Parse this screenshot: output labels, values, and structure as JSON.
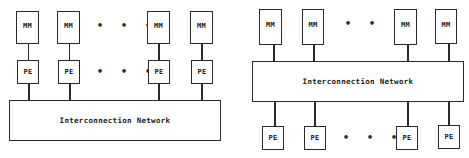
{
  "left_diagram": {
    "memory_modules": [
      {
        "label": "MM"
      },
      {
        "label": "MM"
      },
      {
        "label": "MM"
      },
      {
        "label": "MM"
      }
    ],
    "processing_elements": [
      {
        "label": "PE"
      },
      {
        "label": "PE"
      },
      {
        "label": "PE"
      },
      {
        "label": "PE"
      }
    ],
    "ellipsis_top": "• • •",
    "ellipsis_middle": "• • •",
    "network_label": "Interconnection Network"
  },
  "right_diagram": {
    "memory_modules": [
      {
        "label": "MM"
      },
      {
        "label": "MM"
      },
      {
        "label": "MM"
      },
      {
        "label": "MM"
      }
    ],
    "processing_elements": [
      {
        "label": "PE"
      },
      {
        "label": "PE"
      },
      {
        "label": "PE"
      },
      {
        "label": "PE"
      }
    ],
    "ellipsis_top": "• • •",
    "ellipsis_bottom": "• • •",
    "network_label": "Interconnection Network"
  },
  "colors": {
    "line": "#2a2a2a",
    "background": "#ffffff",
    "text": "#1a1a1a"
  }
}
